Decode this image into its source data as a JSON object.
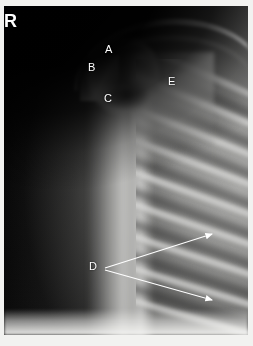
{
  "image": {
    "modality": "radiograph",
    "view": "shoulder / upper chest AP radiograph",
    "side_marker": "R",
    "background_color": "#ffffff",
    "film_dark": "#060606",
    "film_light": "#d6d6d4",
    "annotation_color": "#ffffff"
  },
  "annotations": {
    "letters": [
      {
        "id": "A",
        "label": "A",
        "x": 105,
        "y": 44,
        "target": "distal clavicle / acromial end"
      },
      {
        "id": "B",
        "label": "B",
        "x": 88,
        "y": 62,
        "target": "acromion"
      },
      {
        "id": "C",
        "label": "C",
        "x": 104,
        "y": 93,
        "target": "coracoid process"
      },
      {
        "id": "E",
        "label": "E",
        "x": 168,
        "y": 76,
        "target": "scapular body / glenoid"
      }
    ],
    "pointer_label": {
      "id": "D",
      "label": "D",
      "x": 89,
      "y": 261,
      "target": "posterior rib arcs"
    },
    "arrows": [
      {
        "from_x": 105,
        "from_y": 268,
        "to_x": 216,
        "to_y": 235,
        "color": "#ffffff"
      },
      {
        "from_x": 105,
        "from_y": 270,
        "to_x": 216,
        "to_y": 301,
        "color": "#ffffff"
      }
    ]
  },
  "anatomy": {
    "ribs_visible": 9,
    "regions": [
      "humeral shaft",
      "humeral head",
      "clavicle",
      "acromion",
      "coracoid process",
      "scapula",
      "rib cage",
      "lateral chest wall"
    ]
  }
}
